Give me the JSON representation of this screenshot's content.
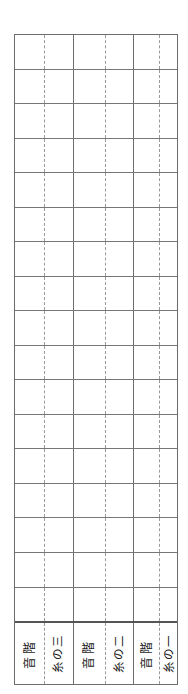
{
  "sheet": {
    "kind": "japanese-string-instrument-notation-grid",
    "background_color": "#ffffff",
    "border_color": "#6e6e6e",
    "rule_color": "#777777",
    "dashed_rule_color": "#9a9a9a",
    "text_color": "#1c1c1c",
    "empty_staff_row_count": 17,
    "empty_cell_text": ""
  },
  "columns": {
    "groups": [
      {
        "id": "group-3",
        "scale_label": "音階",
        "string_label": "糸の三"
      },
      {
        "id": "group-2",
        "scale_label": "音階",
        "string_label": "糸の二"
      },
      {
        "id": "group-1",
        "scale_label": "音階",
        "string_label": "糸の一"
      }
    ]
  }
}
